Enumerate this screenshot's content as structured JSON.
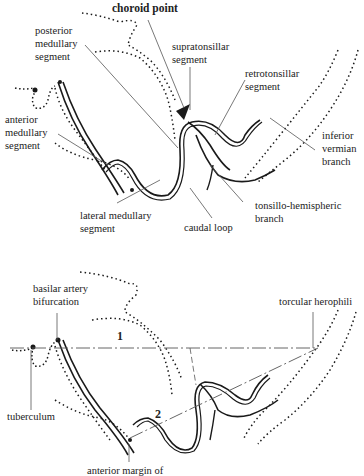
{
  "top_diagram": {
    "labels": {
      "choroid_point": "choroid point",
      "posterior_medullary": "posterior\nmedullary\nsegment",
      "supratonsillar": "supratonsillar\nsegment",
      "retrotonsillar": "retrotonsillar\nsegment",
      "anterior_medullary": "anterior\nmedullary\nsegment",
      "inferior_vermian": "inferior\nvermian\nbranch",
      "lateral_medullary": "lateral medullary\nsegment",
      "tonsillo_hemispheric": "tonsillo-hemispheric\nbranch",
      "caudal_loop": "caudal loop"
    }
  },
  "bottom_diagram": {
    "labels": {
      "basilar_artery": "basilar artery\nbifurcation",
      "torcular": "torcular herophili",
      "tuberculum": "tuberculum",
      "anterior_margin": "anterior margin of",
      "line1": "1",
      "line2": "2"
    }
  },
  "colors": {
    "ink": "#1a1a1a",
    "leader": "#555555",
    "background": "#ffffff"
  }
}
